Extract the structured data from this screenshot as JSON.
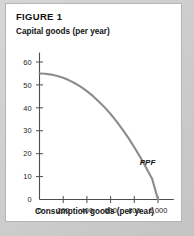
{
  "figure": {
    "title": "FIGURE 1"
  },
  "chart_data": {
    "type": "line",
    "title": "FIGURE 1",
    "subtitle": "",
    "xlabel": "Consumption goods (per year)",
    "ylabel": "Capital goods (per year)",
    "xlim": [
      0,
      1100
    ],
    "ylim": [
      0,
      65
    ],
    "grid": false,
    "legend_position": "inline-right",
    "x_ticks": [
      0,
      200,
      400,
      600,
      800,
      1000
    ],
    "x_tick_labels": [
      "0",
      "200",
      "400",
      "600",
      "800",
      "1,000"
    ],
    "y_ticks": [
      0,
      10,
      20,
      30,
      40,
      50,
      60
    ],
    "y_tick_labels": [
      "0",
      "10",
      "20",
      "30",
      "40",
      "50",
      "60"
    ],
    "annotations": [
      {
        "text": "PPF",
        "x": 880,
        "y": 16
      }
    ],
    "series": [
      {
        "name": "PPF",
        "color": "#8c8c8c",
        "x": [
          0,
          50,
          100,
          150,
          200,
          250,
          300,
          350,
          400,
          450,
          500,
          550,
          600,
          650,
          700,
          750,
          800,
          850,
          900,
          950,
          1000
        ],
        "y": [
          55.0,
          54.9,
          54.5,
          53.9,
          53.1,
          52.0,
          50.7,
          49.1,
          47.3,
          45.2,
          42.8,
          40.2,
          37.3,
          34.1,
          30.6,
          26.9,
          22.8,
          18.5,
          13.9,
          9.1,
          0.0
        ]
      }
    ]
  }
}
